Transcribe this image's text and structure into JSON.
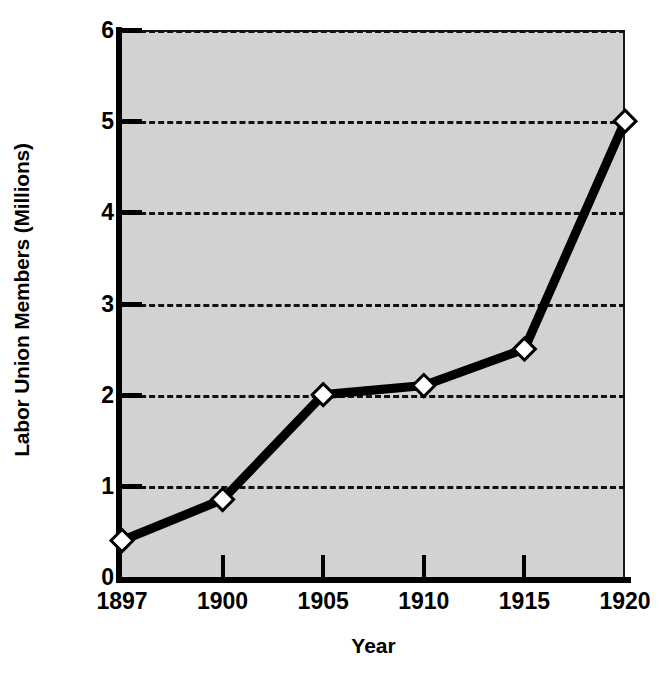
{
  "chart_data": {
    "type": "line",
    "title": "",
    "xlabel": "Year",
    "ylabel": "Labor Union Members (Millions)",
    "categories": [
      "1897",
      "1900",
      "1905",
      "1910",
      "1915",
      "1920"
    ],
    "values": [
      0.4,
      0.85,
      2.0,
      2.1,
      2.5,
      5.0
    ],
    "series": [
      {
        "name": "Labor Union Members",
        "values": [
          0.4,
          0.85,
          2.0,
          2.1,
          2.5,
          5.0
        ]
      }
    ],
    "ylim": [
      0,
      6
    ],
    "y_ticks": [
      0,
      1,
      2,
      3,
      4,
      5,
      6
    ],
    "y_tick_labels": [
      "0",
      "1",
      "2",
      "3",
      "4",
      "5",
      "6"
    ],
    "x_tick_labels": [
      "1897",
      "1900",
      "1905",
      "1910",
      "1915",
      "1920"
    ],
    "grid": true,
    "grid_style": "dashed-horizontal",
    "legend": "none",
    "marker": "diamond",
    "colors": {
      "line": "#000000",
      "marker_fill": "#ffffff",
      "marker_edge": "#000000",
      "plot_background": "#d2d2d2",
      "page_background": "#ffffff",
      "axis": "#000000",
      "gridline": "#111111",
      "text": "#000000"
    }
  }
}
